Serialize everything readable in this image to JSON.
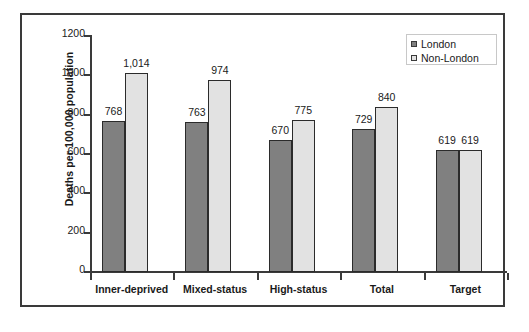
{
  "chart_data": {
    "type": "bar",
    "title": "",
    "xlabel": "",
    "ylabel": "Deaths per 100,000 population",
    "ylim": [
      0,
      1200
    ],
    "ytick_labels": [
      "1200",
      "1000",
      "800",
      "600",
      "400",
      "200",
      "0"
    ],
    "ytick_values": [
      1200,
      1000,
      800,
      600,
      400,
      200,
      0
    ],
    "grid": false,
    "legend_position": "top-right",
    "categories": [
      "Inner-deprived",
      "Mixed-status",
      "High-status",
      "Total",
      "Target"
    ],
    "series": [
      {
        "name": "London",
        "color": "#808080",
        "values": [
          768,
          763,
          670,
          729,
          619
        ],
        "labels": [
          "768",
          "763",
          "670",
          "729",
          "619"
        ]
      },
      {
        "name": "Non-London",
        "color": "#e2e2e2",
        "values": [
          1014,
          974,
          775,
          840,
          619
        ],
        "labels": [
          "1,014",
          "974",
          "775",
          "840",
          "619"
        ]
      }
    ]
  },
  "legend": {
    "items": [
      {
        "label": "London"
      },
      {
        "label": "Non-London"
      }
    ]
  },
  "colors": {
    "london": "#808080",
    "non_london": "#e2e2e2",
    "axis": "#3a3a3a",
    "frame": "#3a3a3a",
    "text": "#1a1a1a"
  }
}
